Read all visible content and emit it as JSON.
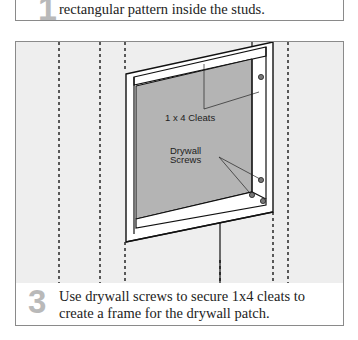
{
  "previous_step": {
    "number": "1",
    "text": "rectangular pattern inside the studs."
  },
  "current_step": {
    "number": "3",
    "text_line1": "Use drywall screws to secure 1x4 cleats to",
    "text_line2": "create a frame for the drywall patch.",
    "illustration": {
      "label_cleats": "1 x 4 Cleats",
      "label_screws_line1": "Drywall",
      "label_screws_line2": "Screws"
    }
  },
  "colors": {
    "step_number": "#b9b9b9",
    "illustration_bg": "#eeeeee",
    "patch_fill": "#b4b4b4",
    "border": "#8a8a8a"
  }
}
